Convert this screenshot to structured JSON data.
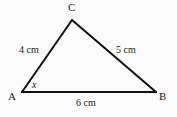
{
  "figure": {
    "type": "triangle-diagram",
    "background_color": "#fbfbfb",
    "stroke_color": "#101010",
    "stroke_width": 2
  },
  "vertices": {
    "a": {
      "label": "A",
      "x": 22,
      "y": 92
    },
    "b": {
      "label": "B",
      "x": 156,
      "y": 92
    },
    "c": {
      "label": "C",
      "x": 72,
      "y": 20
    }
  },
  "sides": {
    "ac": {
      "label": "4 cm",
      "length": 4,
      "unit": "cm"
    },
    "bc": {
      "label": "5 cm",
      "length": 5,
      "unit": "cm"
    },
    "ab": {
      "label": "6 cm",
      "length": 6,
      "unit": "cm"
    }
  },
  "angles": {
    "at_a": {
      "label": "x"
    }
  }
}
